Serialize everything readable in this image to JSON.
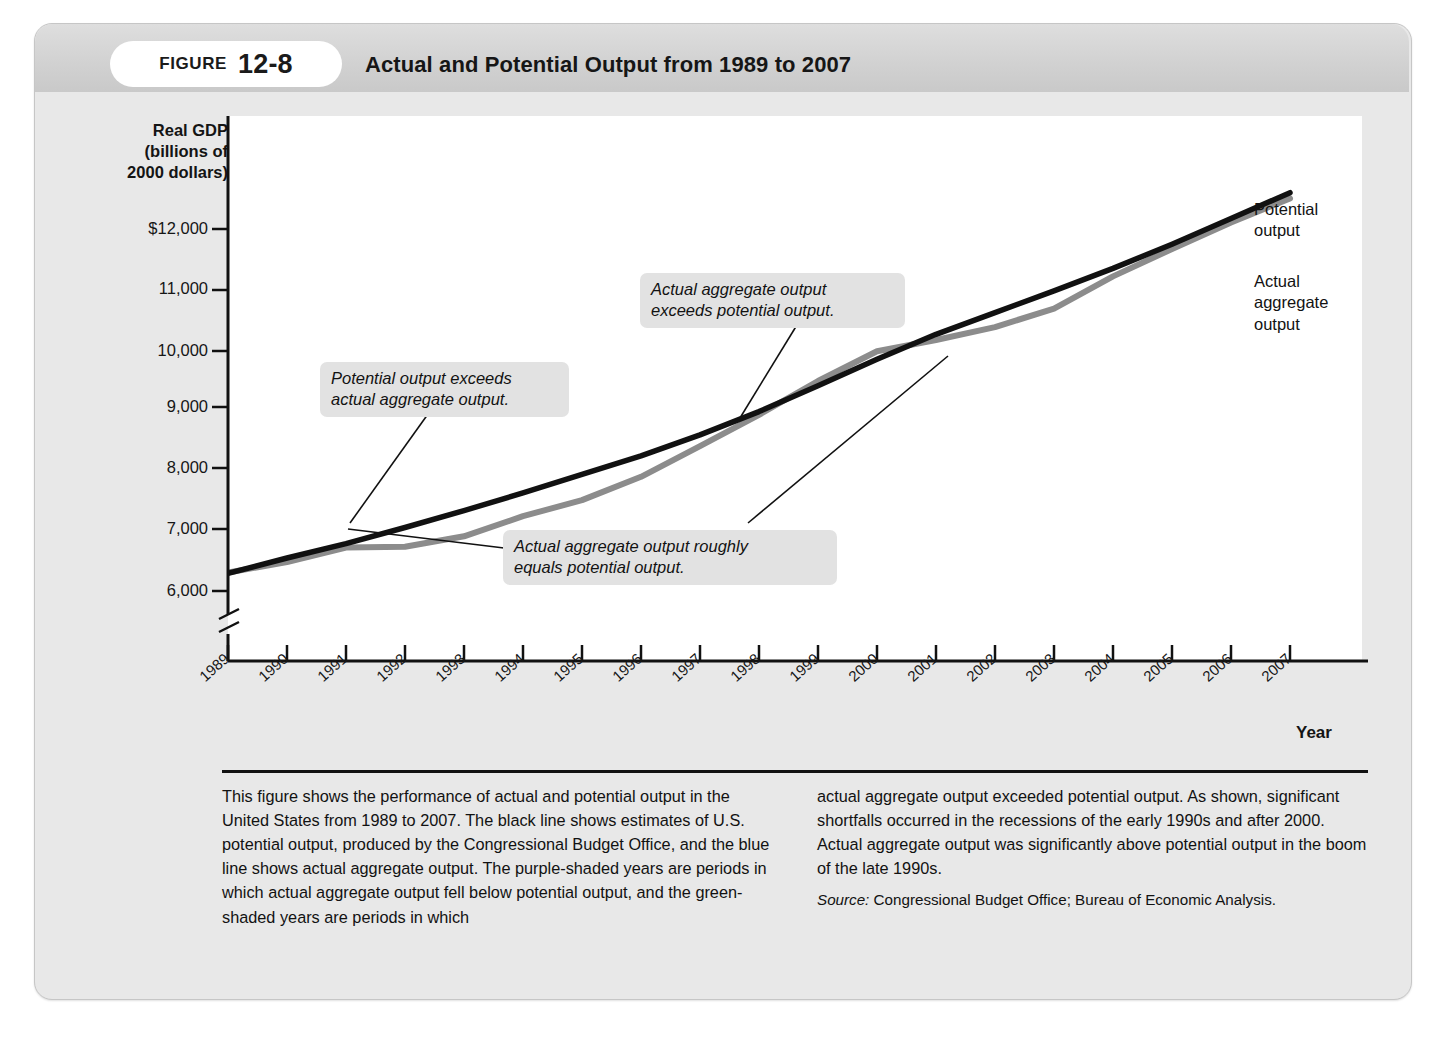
{
  "figure": {
    "label_word": "FIGURE",
    "number": "12-8",
    "title": "Actual and Potential Output from 1989 to 2007"
  },
  "axes": {
    "y_title": "Real GDP\n(billions of\n2000 dollars)",
    "y_title_lines": [
      "Real GDP",
      "(billions of",
      "2000 dollars)"
    ],
    "x_title": "Year",
    "y_ticks": [
      "$12,000",
      "11,000",
      "10,000",
      "9,000",
      "8,000",
      "7,000",
      "6,000"
    ],
    "x_ticks": [
      "1989",
      "1990",
      "1991",
      "1992",
      "1993",
      "1994",
      "1995",
      "1996",
      "1997",
      "1998",
      "1999",
      "2000",
      "2001",
      "2002",
      "2003",
      "2004",
      "2005",
      "2006",
      "2007"
    ],
    "axis_break": true
  },
  "annotations": [
    {
      "id": "potential-exceeds-actual",
      "text": "Potential output exceeds\nactual aggregate output."
    },
    {
      "id": "actual-exceeds-potential",
      "text": "Actual aggregate output\nexceeds potential output."
    },
    {
      "id": "actual-equals-potential",
      "text": "Actual aggregate output roughly\nequals potential output."
    }
  ],
  "series_labels": [
    {
      "id": "potential-output",
      "text": "Potential\noutput"
    },
    {
      "id": "actual-aggregate-output",
      "text": "Actual\naggregate\noutput"
    }
  ],
  "caption": {
    "left": "This figure shows the performance of actual and potential output in the United States from 1989 to 2007. The black line shows estimates of U.S. potential output, produced by the Congressional Budget Office, and the blue line shows actual aggregate output. The purple-shaded years are periods in which actual aggregate output fell below potential output, and the green-shaded years are periods in which",
    "right": "actual aggregate output exceeded potential output. As shown, significant shortfalls occurred in the recessions of the early 1990s and after 2000. Actual aggregate output was significantly above potential output in the boom of the late 1990s.",
    "source_label": "Source:",
    "source_text": "Congressional Budget Office; Bureau of Economic Analysis."
  },
  "colors": {
    "card_background": "#e8e8e8",
    "header_band": "#d2d2d2",
    "plot_background": "#ffffff",
    "potential_line": "#111111",
    "actual_line": "#8c8c8c",
    "callout_background": "#e2e2e2",
    "axis": "#111111"
  },
  "chart_data": {
    "type": "line",
    "title": "Actual and Potential Output from 1989 to 2007",
    "xlabel": "Year",
    "ylabel": "Real GDP (billions of 2000 dollars)",
    "x": [
      1989,
      1990,
      1991,
      1992,
      1993,
      1994,
      1995,
      1996,
      1997,
      1998,
      1999,
      2000,
      2001,
      2002,
      2003,
      2004,
      2005,
      2006,
      2007
    ],
    "ylim": [
      5800,
      12200
    ],
    "xlim": [
      1989,
      2007
    ],
    "grid": false,
    "legend_position": "right-inline",
    "series": [
      {
        "name": "Potential output",
        "color": "#111111",
        "values": [
          6790,
          6980,
          7160,
          7360,
          7570,
          7790,
          8020,
          8250,
          8510,
          8800,
          9120,
          9450,
          9760,
          10030,
          10300,
          10580,
          10880,
          11200,
          11520
        ]
      },
      {
        "name": "Actual aggregate output",
        "color": "#8c8c8c",
        "values": [
          6800,
          6930,
          7110,
          7120,
          7250,
          7500,
          7700,
          7990,
          8370,
          8760,
          9180,
          9550,
          9690,
          9850,
          10080,
          10480,
          10820,
          11150,
          11450
        ]
      }
    ],
    "ytick_values": [
      12000,
      11000,
      10000,
      9000,
      8000,
      7000,
      6000
    ]
  }
}
